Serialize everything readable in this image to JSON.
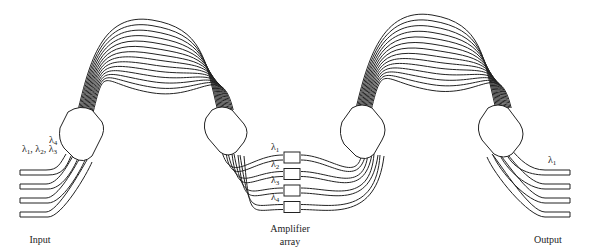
{
  "diagram": {
    "stages": [
      "input",
      "star-coupler",
      "waveguide-array",
      "star-coupler",
      "amplifier-array",
      "star-coupler",
      "waveguide-array",
      "star-coupler",
      "output"
    ],
    "input": {
      "label": "Input",
      "port_count": 4,
      "wavelength_labels": [
        {
          "symbol": "λ",
          "sub": "4",
          "text": ""
        },
        {
          "symbol": "λ",
          "sub": "1",
          "text": ", λ2, λ3"
        }
      ],
      "label_top": {
        "base": "λ",
        "sub": "4"
      },
      "label_bottom": {
        "parts": [
          {
            "base": "λ",
            "sub": "1"
          },
          {
            "base": "λ",
            "sub": "2"
          },
          {
            "base": "λ",
            "sub": "3"
          }
        ],
        "sep": ", "
      }
    },
    "waveguide_array_left": {
      "waveguide_count": 7
    },
    "amplifier_array": {
      "label_line1": "Amplifier",
      "label_line2": "array",
      "amplifier_count": 4,
      "channels": [
        {
          "base": "λ",
          "sub": "1"
        },
        {
          "base": "λ",
          "sub": "2"
        },
        {
          "base": "λ",
          "sub": "3"
        },
        {
          "base": "λ",
          "sub": "4"
        }
      ]
    },
    "waveguide_array_right": {
      "waveguide_count": 7
    },
    "output": {
      "label": "Output",
      "port_count": 4,
      "wavelength_label": {
        "base": "λ",
        "sub": "1"
      }
    }
  }
}
